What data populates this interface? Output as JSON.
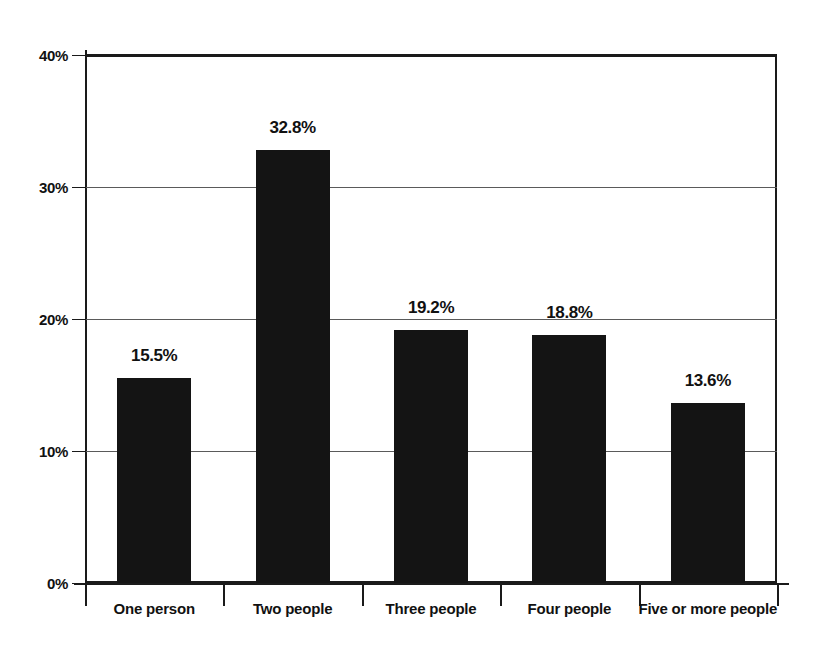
{
  "chart_data": {
    "type": "bar",
    "title": "",
    "subtitle": "",
    "xlabel": "",
    "ylabel": "",
    "categories": [
      "One person",
      "Two people",
      "Three people",
      "Four people",
      "Five or more people"
    ],
    "values": [
      15.5,
      32.8,
      19.2,
      18.8,
      13.6
    ],
    "value_labels": [
      "15.5%",
      "32.8%",
      "19.2%",
      "18.8%",
      "13.6%"
    ],
    "ylim": [
      0,
      40
    ],
    "ytick_values": [
      0,
      10,
      20,
      30,
      40
    ],
    "ytick_labels": [
      "0%",
      "10%",
      "20%",
      "30%",
      "40%"
    ],
    "grid": true,
    "grid_axis": "y",
    "legend": false,
    "legend_position": "none",
    "bar_color": "#141414",
    "axis_color": "#1a1a1a",
    "gridline_color": "#5a5a5a",
    "background_color": "#ffffff",
    "annotations": []
  }
}
